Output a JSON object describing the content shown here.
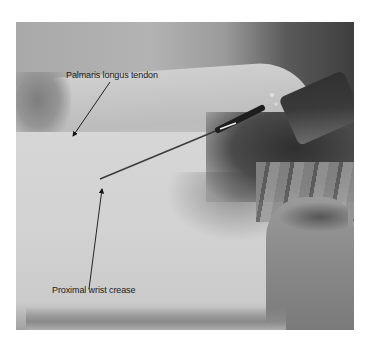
{
  "figure": {
    "colors": {
      "page_background": "#ffffff",
      "photo_midtone": "#c9c9c9",
      "dark_shadow": "#2f2f2f",
      "label_text": "#1a1a1a"
    },
    "annotations": [
      {
        "label": "Palmaris longus tendon",
        "arrow_from": [
          110,
          80
        ],
        "arrow_to": [
          72,
          137
        ]
      },
      {
        "label": "Proximal wrist crease",
        "arrow_from": [
          88,
          290
        ],
        "arrow_to": [
          102,
          188
        ]
      }
    ],
    "needle": {
      "from": [
        100,
        179
      ],
      "to": [
        218,
        130
      ]
    }
  }
}
